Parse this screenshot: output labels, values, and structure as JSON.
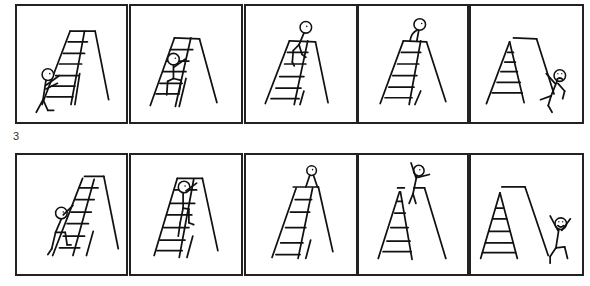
{
  "comic": {
    "section_label": "3",
    "rows": [
      {
        "name": "top-row",
        "panels": [
          {
            "index": 1,
            "scene": "stick figure approaches ladder from left, reaching toward it"
          },
          {
            "index": 2,
            "scene": "stick figure climbing the ladder"
          },
          {
            "index": 3,
            "scene": "stick figure near the top of the ladder"
          },
          {
            "index": 4,
            "scene": "stick figure standing on top of the ladder"
          },
          {
            "index": 5,
            "scene": "stick figure fallen on the right side of the ladder, sad face"
          }
        ]
      },
      {
        "name": "bottom-row",
        "panels": [
          {
            "index": 6,
            "scene": "stick figure starts climbing from the bottom"
          },
          {
            "index": 7,
            "scene": "stick figure climbing up the ladder"
          },
          {
            "index": 8,
            "scene": "stick figure sitting on the ladder top"
          },
          {
            "index": 9,
            "scene": "stick figure jumping off the top with arms raised"
          },
          {
            "index": 10,
            "scene": "stick figure landed on right side, happy, arms raised"
          }
        ]
      }
    ],
    "colors": {
      "ink": "#111111",
      "background": "#ffffff"
    }
  }
}
